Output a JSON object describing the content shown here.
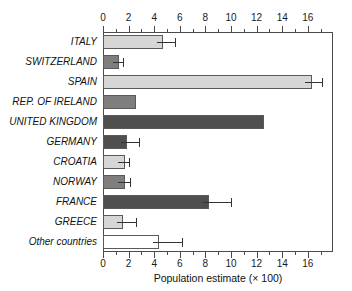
{
  "chart_data": {
    "type": "bar",
    "orientation": "horizontal",
    "title": "",
    "xlabel": "Population estimate (× 100)",
    "ylabel": "",
    "xlim": [
      0,
      17.97
    ],
    "xticks": [
      0,
      2,
      4,
      6,
      8,
      10,
      12,
      14,
      16
    ],
    "xticklabels": [
      "0",
      "2",
      "4",
      "6",
      "8",
      "10",
      "12",
      "14",
      "16"
    ],
    "minor_tick_step": 1,
    "axis_top": true,
    "axis_bottom": true,
    "grid": false,
    "legend": null,
    "categories": [
      "ITALY",
      "SWITZERLAND",
      "SPAIN",
      "REP. OF IRELAND",
      "UNITED KINGDOM",
      "GERMANY",
      "CROATIA",
      "NORWAY",
      "FRANCE",
      "GREECE",
      "Other countries"
    ],
    "values": [
      4.7,
      1.25,
      16.3,
      2.6,
      12.6,
      1.9,
      1.7,
      1.7,
      8.3,
      1.6,
      4.4
    ],
    "error_high": [
      5.6,
      1.55,
      17.1,
      null,
      null,
      2.8,
      2.0,
      2.1,
      10.0,
      2.6,
      6.2
    ],
    "fills": [
      "light",
      "medium",
      "light",
      "medium",
      "dark",
      "dark",
      "light",
      "medium",
      "dark",
      "light",
      "white"
    ],
    "colors": {
      "light": "#d6d6d6",
      "medium": "#7e7e7e",
      "dark": "#4f4f4f",
      "white": "#ffffff",
      "edge": "#5a5a5a",
      "axis": "#4a4a4a",
      "error": "#333333",
      "text": "#111111"
    }
  }
}
